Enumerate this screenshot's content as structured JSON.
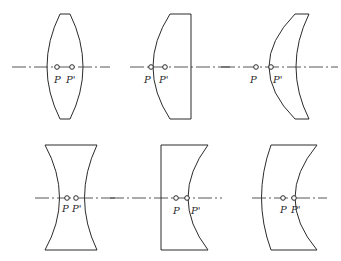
{
  "diagram": {
    "stroke_color": "#2b2b2b",
    "background": "#ffffff",
    "lenses": [
      {
        "id": "biconvex",
        "labels": {
          "p": "P",
          "p_prime": "P'"
        }
      },
      {
        "id": "plano-convex",
        "labels": {
          "p": "P",
          "p_prime": "P'"
        }
      },
      {
        "id": "positive-meniscus",
        "labels": {
          "p": "P",
          "p_prime": "P'"
        }
      },
      {
        "id": "biconcave",
        "labels": {
          "p": "P",
          "p_prime": "P'"
        }
      },
      {
        "id": "plano-concave",
        "labels": {
          "p": "P",
          "p_prime": "P'"
        }
      },
      {
        "id": "negative-meniscus",
        "labels": {
          "p": "P",
          "p_prime": "P'"
        }
      }
    ]
  }
}
